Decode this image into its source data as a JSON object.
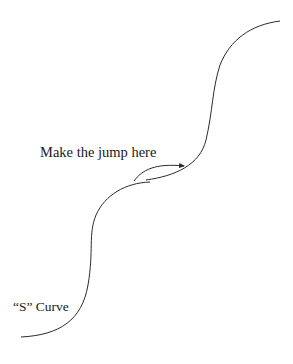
{
  "diagram": {
    "labels": {
      "jump": "Make the jump here",
      "s_curve": "“S” Curve"
    },
    "colors": {
      "stroke": "#2b2b2b",
      "text": "#1a1a1a",
      "background": "#ffffff"
    },
    "elements": [
      {
        "type": "curve",
        "name": "lower-s-curve",
        "description": "S-shaped curve rising from bottom-left to the jump point"
      },
      {
        "type": "curve",
        "name": "upper-s-curve",
        "description": "Second S-shaped curve starting near jump point rising to top-right"
      },
      {
        "type": "arrow",
        "name": "jump-arrow",
        "description": "Arrow pointing from lower curve to upper curve"
      }
    ]
  }
}
